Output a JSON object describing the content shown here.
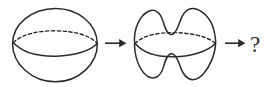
{
  "figure": {
    "caption": "",
    "background_color": "#fefefe",
    "ink_color": "#2b2b2b",
    "width": 270,
    "height": 87,
    "sequence_label": "sphere then deformed sphere then unknown",
    "items": [
      {
        "id": "sphere",
        "label": "sphere",
        "kind": "surface",
        "description": "round sphere with equator drawn, front half solid and back half dashed",
        "equator": {
          "front": "solid",
          "back": "dashed"
        },
        "bounds": {
          "x": 12,
          "y": 8,
          "width": 86,
          "height": 74
        }
      },
      {
        "id": "arrow-1",
        "label": "arrow",
        "kind": "arrow",
        "glyph": "→",
        "bounds": {
          "x": 104,
          "y": 38,
          "width": 22,
          "height": 10
        }
      },
      {
        "id": "deformed-sphere",
        "label": "deformed sphere",
        "kind": "surface",
        "description": "sphere deformed with two saddle indentations, one on top centre and one on bottom centre, equator drawn with solid front and dashed back",
        "equator": {
          "front": "solid",
          "back": "dashed"
        },
        "bumps": {
          "top": 2,
          "bottom": 2
        },
        "bounds": {
          "x": 134,
          "y": 8,
          "width": 82,
          "height": 73
        }
      },
      {
        "id": "arrow-2",
        "label": "arrow",
        "kind": "arrow",
        "glyph": "→",
        "bounds": {
          "x": 224,
          "y": 38,
          "width": 22,
          "height": 10
        }
      },
      {
        "id": "question-mark",
        "label": "?",
        "kind": "text",
        "bounds": {
          "x": 248,
          "y": 30,
          "width": 14,
          "height": 24
        }
      }
    ]
  },
  "text": {
    "question_mark": "?"
  }
}
